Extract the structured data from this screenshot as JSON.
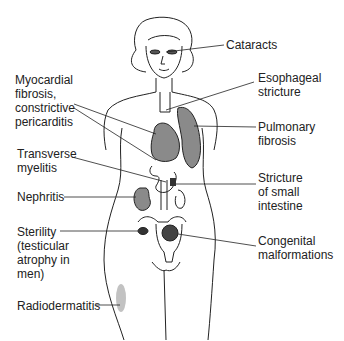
{
  "diagram": {
    "type": "anatomical-illustration",
    "colors": {
      "line": "#222222",
      "organ_fill": "#8a8a8a",
      "text": "#222222",
      "background": "#ffffff"
    },
    "labels": [
      {
        "id": "cataracts",
        "text": "Cataracts",
        "side": "right",
        "x": 226,
        "y": 38
      },
      {
        "id": "esophageal-stricture",
        "text": "Esophageal\nstricture",
        "side": "right",
        "x": 258,
        "y": 71
      },
      {
        "id": "myocardial-fibrosis",
        "text": "Myocardial\nfibrosis,\nconstrictive\npericarditis",
        "side": "left",
        "x": 15,
        "y": 73
      },
      {
        "id": "pulmonary-fibrosis",
        "text": "Pulmonary\nfibrosis",
        "side": "right",
        "x": 258,
        "y": 120
      },
      {
        "id": "transverse-myelitis",
        "text": "Transverse\nmyelitis",
        "side": "left",
        "x": 17,
        "y": 147
      },
      {
        "id": "stricture-small-intestine",
        "text": "Stricture\nof small\nintestine",
        "side": "right",
        "x": 258,
        "y": 171
      },
      {
        "id": "nephritis",
        "text": "Nephritis",
        "side": "left",
        "x": 17,
        "y": 190
      },
      {
        "id": "sterility",
        "text": "Sterility\n(testicular\natrophy in\nmen)",
        "side": "left",
        "x": 17,
        "y": 225
      },
      {
        "id": "congenital-malformations",
        "text": "Congenital\nmalformations",
        "side": "right",
        "x": 258,
        "y": 234
      },
      {
        "id": "radiodermatitis",
        "text": "Radiodermatitis",
        "side": "left",
        "x": 17,
        "y": 299
      }
    ]
  }
}
